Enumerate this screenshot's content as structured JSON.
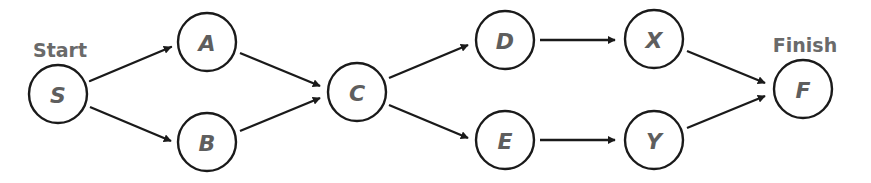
{
  "diagram": {
    "type": "directed-graph",
    "labels": {
      "start": "Start",
      "finish": "Finish"
    },
    "nodes": [
      {
        "id": "S",
        "label": "S",
        "x": 58,
        "y": 94
      },
      {
        "id": "A",
        "label": "A",
        "x": 207,
        "y": 42
      },
      {
        "id": "B",
        "label": "B",
        "x": 207,
        "y": 142
      },
      {
        "id": "C",
        "label": "C",
        "x": 357,
        "y": 92
      },
      {
        "id": "D",
        "label": "D",
        "x": 505,
        "y": 40
      },
      {
        "id": "E",
        "label": "E",
        "x": 505,
        "y": 140
      },
      {
        "id": "X",
        "label": "X",
        "x": 654,
        "y": 39
      },
      {
        "id": "Y",
        "label": "Y",
        "x": 654,
        "y": 140
      },
      {
        "id": "F",
        "label": "F",
        "x": 803,
        "y": 89
      }
    ],
    "edges": [
      {
        "from": "S",
        "to": "A"
      },
      {
        "from": "S",
        "to": "B"
      },
      {
        "from": "A",
        "to": "C"
      },
      {
        "from": "B",
        "to": "C"
      },
      {
        "from": "C",
        "to": "D"
      },
      {
        "from": "C",
        "to": "E"
      },
      {
        "from": "D",
        "to": "X"
      },
      {
        "from": "E",
        "to": "Y"
      },
      {
        "from": "X",
        "to": "F"
      },
      {
        "from": "Y",
        "to": "F"
      }
    ],
    "colors": {
      "stroke": "#1a1a1a",
      "node_text": "#5e5e5e",
      "label_text": "#6a6a6a",
      "background": "#ffffff"
    }
  }
}
